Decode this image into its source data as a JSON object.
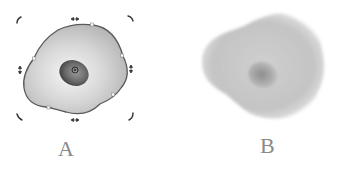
{
  "panels": [
    {
      "id": "A",
      "label": "A",
      "description": "Selected cell shape with transform handles",
      "state": "selected"
    },
    {
      "id": "B",
      "label": "B",
      "description": "Cell shape with soft-edge gradient effect",
      "state": "unselected"
    }
  ],
  "colors": {
    "outline": "#5a5a5a",
    "cell_light": "#f4f4f4",
    "cell_mid": "#c8c8c8",
    "cell_dark": "#a8a8a8",
    "nucleus_light": "#8a8a8a",
    "nucleus_dark": "#3e3e3e",
    "handle": "#333333",
    "label": "#8a8a8a"
  },
  "icons": {
    "rotate_handle": "corner-arc",
    "resize_horizontal": "double-arrow-horizontal",
    "resize_vertical": "double-arrow-vertical",
    "center_point": "target-circle"
  }
}
